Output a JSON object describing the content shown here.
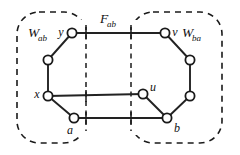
{
  "figure": {
    "name": "graph-cut-diagram",
    "width": 240,
    "height": 155,
    "background_color": "#ffffff",
    "line_color": "#1a1a1a",
    "node_fill_color": "#ffffff"
  },
  "labels": {
    "left_region": {
      "base": "W",
      "sub": "ab",
      "text": "Wₐᵦ"
    },
    "right_region": {
      "base": "W",
      "sub": "ba",
      "text": "Wᵦₐ"
    },
    "cut": {
      "base": "F",
      "sub": "ab",
      "text": "Fₐᵦ"
    },
    "vertex_y": "y",
    "vertex_x": "x",
    "vertex_a": "a",
    "vertex_u": "u",
    "vertex_v": "v",
    "vertex_b": "b"
  },
  "regions": [
    {
      "id": "W_ab",
      "name": "left-region-box",
      "style": "dashed-rounded-rect",
      "x": 17,
      "y": 12,
      "width": 69,
      "height": 131,
      "rx": 22
    },
    {
      "id": "W_ba",
      "name": "right-region-box",
      "style": "dashed-rounded-rect",
      "x": 131,
      "y": 12,
      "width": 91,
      "height": 131,
      "rx": 22
    }
  ],
  "cut_lines": [
    {
      "id": "cut-left",
      "name": "cut-boundary-left",
      "x1": 86,
      "y1": 25,
      "x2": 86,
      "y2": 131
    },
    {
      "id": "cut-right",
      "name": "cut-boundary-right",
      "x1": 131,
      "y1": 25,
      "x2": 131,
      "y2": 131
    }
  ],
  "nodes": [
    {
      "id": "y",
      "name": "vertex-y",
      "cx": 72,
      "cy": 33,
      "r": 4.6,
      "label": "y",
      "label_dx": -11,
      "label_dy": 3
    },
    {
      "id": "p1",
      "name": "vertex-left-upper",
      "cx": 48,
      "cy": 60,
      "r": 4.6,
      "label": "",
      "label_dx": 0,
      "label_dy": 0
    },
    {
      "id": "x",
      "name": "vertex-x",
      "cx": 48,
      "cy": 96,
      "r": 4.6,
      "label": "x",
      "label_dx": -11,
      "label_dy": 2
    },
    {
      "id": "a",
      "name": "vertex-a",
      "cx": 74,
      "cy": 118,
      "r": 4.6,
      "label": "a",
      "label_dx": -4,
      "label_dy": 16
    },
    {
      "id": "u",
      "name": "vertex-u",
      "cx": 143,
      "cy": 94,
      "r": 4.6,
      "label": "u",
      "label_dx": 8,
      "label_dy": -3
    },
    {
      "id": "v",
      "name": "vertex-v",
      "cx": 165,
      "cy": 33,
      "r": 4.6,
      "label": "v",
      "label_dx": 9,
      "label_dy": 3
    },
    {
      "id": "q1",
      "name": "vertex-right-upper",
      "cx": 190,
      "cy": 60,
      "r": 4.6,
      "label": "",
      "label_dx": 0,
      "label_dy": 0
    },
    {
      "id": "q2",
      "name": "vertex-right-lower",
      "cx": 190,
      "cy": 96,
      "r": 4.6,
      "label": "",
      "label_dx": 0,
      "label_dy": 0
    },
    {
      "id": "b",
      "name": "vertex-b",
      "cx": 167,
      "cy": 118,
      "r": 4.6,
      "label": "b",
      "label_dx": 9,
      "label_dy": 14
    }
  ],
  "edges": [
    {
      "id": "y-v",
      "name": "edge-y-v",
      "from": "y",
      "to": "v",
      "crosses_cut": true
    },
    {
      "id": "x-u",
      "name": "edge-x-u",
      "from": "x",
      "to": "u",
      "crosses_cut": true
    },
    {
      "id": "a-b",
      "name": "edge-a-b",
      "from": "a",
      "to": "b",
      "crosses_cut": true
    },
    {
      "id": "y-p1",
      "name": "edge-y-p1",
      "from": "y",
      "to": "p1",
      "crosses_cut": false
    },
    {
      "id": "p1-x",
      "name": "edge-p1-x",
      "from": "p1",
      "to": "x",
      "crosses_cut": false
    },
    {
      "id": "x-a",
      "name": "edge-x-a",
      "from": "x",
      "to": "a",
      "crosses_cut": false
    },
    {
      "id": "v-q1",
      "name": "edge-v-q1",
      "from": "v",
      "to": "q1",
      "crosses_cut": false
    },
    {
      "id": "q1-q2",
      "name": "edge-q1-q2",
      "from": "q1",
      "to": "q2",
      "crosses_cut": false
    },
    {
      "id": "q2-b",
      "name": "edge-q2-b",
      "from": "q2",
      "to": "b",
      "crosses_cut": false
    },
    {
      "id": "u-b",
      "name": "edge-u-b",
      "from": "u",
      "to": "b",
      "crosses_cut": false
    }
  ],
  "cut_ticks": [
    {
      "name": "tick-cut-left-top",
      "x": 86,
      "y": 33
    },
    {
      "name": "tick-cut-left-mid",
      "x": 86,
      "y": 96
    },
    {
      "name": "tick-cut-left-bottom",
      "x": 86,
      "y": 118
    },
    {
      "name": "tick-cut-right-top",
      "x": 131,
      "y": 33
    },
    {
      "name": "tick-cut-right-bottom",
      "x": 131,
      "y": 118
    }
  ],
  "text_positions": {
    "left_region_label": {
      "x": 28,
      "y": 37
    },
    "right_region_label": {
      "x": 184,
      "y": 37
    },
    "cut_label": {
      "x": 100,
      "y": 23
    }
  }
}
